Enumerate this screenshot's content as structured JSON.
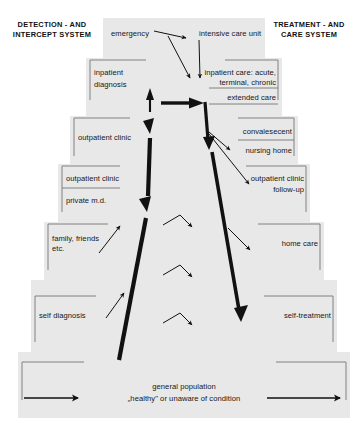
{
  "figure": {
    "type": "diagram",
    "kind": "stepped-pyramid-flow",
    "headers": {
      "left": [
        "DETECTION - AND",
        "INTERCEPT SYSTEM"
      ],
      "right": [
        "TREATMENT - AND",
        "CARE SYSTEM"
      ]
    },
    "colors": {
      "tier_fill": "#e8e8e8",
      "bracket_line": "#6b6b6b",
      "arrow": "#111111",
      "text": "#161616",
      "background": "#ffffff"
    },
    "tiers": [
      {
        "level": 1,
        "left_label": "emergency",
        "right_label": "intensive care unit"
      },
      {
        "level": 2,
        "left_label": "inpatient\ndiagnosis",
        "left_label_line1": "inpatient",
        "left_label_line2": "diagnosis",
        "right_label_line1": "inpatient care: acute,",
        "right_label_line2": "terminal, chronic",
        "right_label_2": "extended care"
      },
      {
        "level": 3,
        "left_label": "outpatient clinic",
        "right_label_1": "convalesecent",
        "right_label_2": "nursing home"
      },
      {
        "level": 4,
        "left_label_1": "outpatient clinic",
        "left_label_2": "private m.d.",
        "right_label_line1": "outpatient clinic",
        "right_label_line2": "follow-up"
      },
      {
        "level": 5,
        "left_label_line1": "family, friends",
        "left_label_line2": "etc.",
        "right_label": "home care"
      },
      {
        "level": 6,
        "left_label": "self diagnosis",
        "right_label": "self-treatment"
      },
      {
        "level": 7,
        "center_label_line1": "general population",
        "center_label_line2": "„healthy\" or unaware of condition"
      }
    ],
    "arrows": {
      "thick_up_left": "ascending flow from general population through detection system",
      "thick_down_right": "descending flow from extended care through treatment system",
      "thick_horizontal_center": "inpatient diagnosis to extended care",
      "bottom_left": "entry arrow into general population (left)",
      "bottom_right": "exit arrow out of general population (right)",
      "chevrons": 3,
      "thin_diagonals": 7
    }
  }
}
